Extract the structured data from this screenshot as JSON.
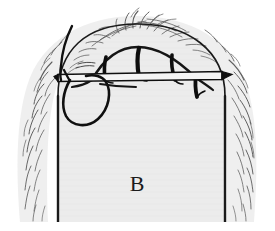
{
  "figure": {
    "panel_label": "B",
    "canvas": {
      "width": 275,
      "height": 231
    },
    "colors": {
      "background": "#ffffff",
      "skin_fill": "#ececec",
      "skin_fill_edge": "#e4e4e4",
      "ink": "#111111",
      "hair_stroke": "#6b6b6b",
      "outline": "#1a1a1a",
      "label": "#1b1b1b"
    },
    "elements": {
      "scalp_label": "scalp dome",
      "incision_label": "arched incision line",
      "instrument_label": "horizontal needle holder bar",
      "suture_loop_label": "suture thread loop",
      "suture_tail_label": "suture thread tail",
      "stitch_count": 4,
      "hair_tuft_count": 58
    }
  }
}
